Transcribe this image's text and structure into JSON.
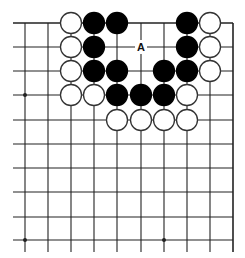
{
  "diagram": {
    "type": "go-board-fragment",
    "columns_x": [
      25,
      48,
      71,
      94,
      117,
      141,
      164,
      187,
      210,
      233
    ],
    "rows_y": [
      23,
      47,
      71,
      95,
      120,
      144,
      168,
      192,
      217,
      240
    ],
    "edges": {
      "top": true,
      "right": true,
      "left": false,
      "bottom": false
    },
    "line_extent": {
      "left_x": 13,
      "bottom_y": 252
    },
    "star_points": [
      {
        "col": 0,
        "row": 3
      },
      {
        "col": 0,
        "row": 9
      },
      {
        "col": 6,
        "row": 9
      }
    ],
    "stone_radius": 10.5,
    "colors": {
      "line": "#222222",
      "black_stone": "#000000",
      "white_stone": "#ffffff",
      "stone_outline": "#333333",
      "background": "#ffffff"
    },
    "stones": [
      {
        "color": "white",
        "col": 2,
        "row": 0
      },
      {
        "color": "black",
        "col": 3,
        "row": 0
      },
      {
        "color": "black",
        "col": 4,
        "row": 0
      },
      {
        "color": "black",
        "col": 7,
        "row": 0
      },
      {
        "color": "white",
        "col": 8,
        "row": 0
      },
      {
        "color": "white",
        "col": 2,
        "row": 1
      },
      {
        "color": "black",
        "col": 3,
        "row": 1
      },
      {
        "color": "black",
        "col": 7,
        "row": 1
      },
      {
        "color": "white",
        "col": 8,
        "row": 1
      },
      {
        "color": "white",
        "col": 2,
        "row": 2
      },
      {
        "color": "black",
        "col": 3,
        "row": 2
      },
      {
        "color": "black",
        "col": 4,
        "row": 2
      },
      {
        "color": "black",
        "col": 6,
        "row": 2
      },
      {
        "color": "black",
        "col": 7,
        "row": 2
      },
      {
        "color": "white",
        "col": 8,
        "row": 2
      },
      {
        "color": "white",
        "col": 2,
        "row": 3
      },
      {
        "color": "white",
        "col": 3,
        "row": 3
      },
      {
        "color": "black",
        "col": 4,
        "row": 3
      },
      {
        "color": "black",
        "col": 5,
        "row": 3
      },
      {
        "color": "black",
        "col": 6,
        "row": 3
      },
      {
        "color": "white",
        "col": 7,
        "row": 3
      },
      {
        "color": "white",
        "col": 4,
        "row": 4
      },
      {
        "color": "white",
        "col": 5,
        "row": 4
      },
      {
        "color": "white",
        "col": 6,
        "row": 4
      },
      {
        "color": "white",
        "col": 7,
        "row": 4
      }
    ],
    "labels": [
      {
        "text": "A",
        "col": 5,
        "row": 1
      }
    ]
  }
}
